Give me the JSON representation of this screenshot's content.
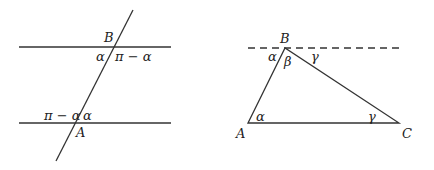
{
  "figure_left": {
    "labels": {
      "B": "B",
      "A": "A",
      "alpha_top": "α",
      "pi_minus_alpha_top": "π − α",
      "pi_minus_alpha_bottom": "π − α",
      "alpha_bottom": "α"
    }
  },
  "figure_right": {
    "labels": {
      "B": "B",
      "A": "A",
      "C": "C",
      "alpha_at_B": "α",
      "beta_at_B": "β",
      "gamma_at_B": "γ",
      "alpha_at_A": "α",
      "gamma_at_C": "γ"
    }
  },
  "colors": {
    "stroke": "#333333",
    "text": "#222222"
  }
}
